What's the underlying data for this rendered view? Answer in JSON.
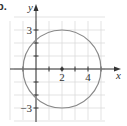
{
  "chart_data": {
    "type": "line",
    "part_label": "b.",
    "title": "",
    "xlabel": "x",
    "ylabel": "y",
    "xlim": [
      -2,
      5
    ],
    "ylim": [
      -4,
      4
    ],
    "grid": true,
    "x_ticks": [
      -1,
      1,
      2,
      3,
      4,
      5
    ],
    "y_ticks": [
      -3,
      -2,
      -1,
      1,
      2,
      3
    ],
    "x_tick_labels": [
      {
        "value": 2,
        "label": "2"
      },
      {
        "value": 4,
        "label": "4"
      }
    ],
    "y_tick_labels": [
      {
        "value": 3,
        "label": "3"
      },
      {
        "value": -3,
        "label": "−3"
      }
    ],
    "series": [
      {
        "name": "circle",
        "shape": "circle",
        "center": [
          2,
          0
        ],
        "radius": 3,
        "color": "#888888"
      }
    ],
    "points": [
      {
        "x": 2,
        "y": 0,
        "label": "center"
      }
    ]
  }
}
